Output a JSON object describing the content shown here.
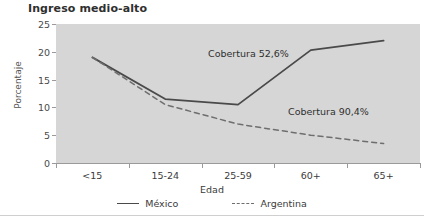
{
  "chart_data": {
    "type": "line",
    "title": "Ingreso medio-alto",
    "xlabel": "Edad",
    "ylabel": "Porcentaje",
    "categories": [
      "<15",
      "15-24",
      "25-59",
      "60+",
      "65+"
    ],
    "ylim": [
      0,
      25
    ],
    "yticks": [
      0,
      5,
      10,
      15,
      20,
      25
    ],
    "grid": false,
    "legend_position": "bottom",
    "plot_background": "#d6d6d6",
    "series": [
      {
        "name": "México",
        "style": "solid",
        "color": "#4a4a4a",
        "values": [
          19.0,
          11.5,
          10.5,
          20.3,
          22.0
        ]
      },
      {
        "name": "Argentina",
        "style": "dashed",
        "color": "#6e6e6e",
        "values": [
          19.0,
          10.5,
          7.0,
          5.0,
          3.5
        ]
      }
    ],
    "annotations": [
      {
        "text": "Cobertura 52,6%",
        "series": "México"
      },
      {
        "text": "Cobertura 90,4%",
        "series": "Argentina"
      }
    ]
  },
  "legend": {
    "items": [
      {
        "label": "México"
      },
      {
        "label": "Argentina"
      }
    ]
  }
}
